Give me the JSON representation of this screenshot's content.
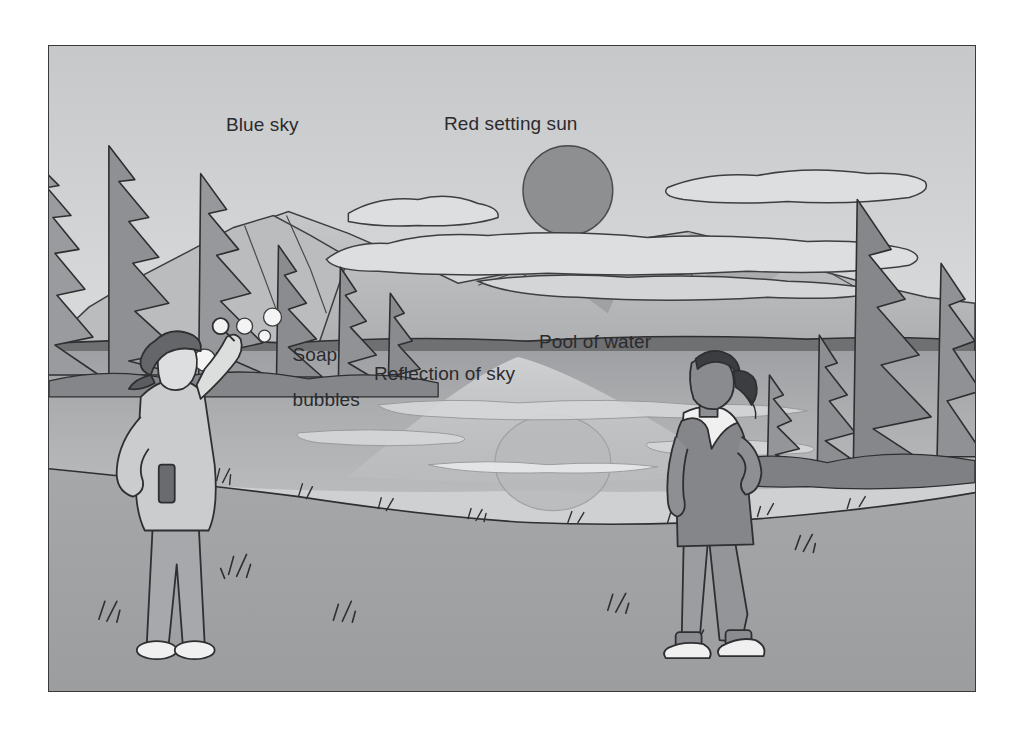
{
  "figure": {
    "border_color": "#3a3a3a",
    "background": "#ffffff"
  },
  "labels": {
    "blue_sky": "Blue sky",
    "red_setting_sun": "Red setting sun",
    "soap_bubbles_line1": "Soap",
    "soap_bubbles_line2": "bubbles",
    "reflection_of_sky": "Reflection of sky",
    "pool_of_water": "Pool of water"
  },
  "palette": {
    "sky_top": "#c9cacc",
    "sky_bottom": "#d8d9da",
    "sun": "#8e8f91",
    "cloud": "#dcdddd",
    "mountain_light": "#c0c1c3",
    "mountain_mid": "#b2b3b5",
    "mountain_dark": "#9d9ea0",
    "far_shore": "#6f7072",
    "water": "#a9aaac",
    "water_reflection": "#c4c5c7",
    "ground": "#a2a3a5",
    "tree_dark": "#85868a",
    "tree_mid": "#9a9b9e",
    "outline": "#2f2f31",
    "skin_light": "#dedfe0",
    "skin_dark": "#8c8d90",
    "shirt": "#c8c9cb",
    "pants": "#93949700",
    "cap": "#6d6e71",
    "dress": "#88898c",
    "white": "#f2f2f2",
    "text": "#2b2b2e"
  },
  "scene": {
    "sun": {
      "cx": 520,
      "cy": 145,
      "r": 45
    },
    "reflected_sun": {
      "cx": 505,
      "cy": 418,
      "rx": 58,
      "ry": 48
    },
    "bubbles": [
      {
        "cx": 228,
        "cy": 300,
        "r": 5
      },
      {
        "cx": 243,
        "cy": 283,
        "r": 8
      },
      {
        "cx": 262,
        "cy": 293,
        "r": 6
      },
      {
        "cx": 272,
        "cy": 275,
        "r": 9
      },
      {
        "cx": 205,
        "cy": 317,
        "r": 11
      },
      {
        "cx": 216,
        "cy": 325,
        "r": 7
      }
    ],
    "figures": [
      {
        "name": "boy-blowing-bubbles",
        "side": "left"
      },
      {
        "name": "girl-watching",
        "side": "right"
      }
    ]
  }
}
